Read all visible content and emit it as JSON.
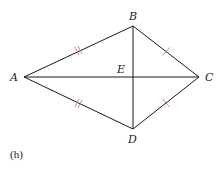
{
  "figure": {
    "caption": "(h)",
    "shape": "kite",
    "vertices": {
      "A": {
        "label": "A",
        "x": 24,
        "y": 77
      },
      "B": {
        "label": "B",
        "x": 133,
        "y": 26
      },
      "C": {
        "label": "C",
        "x": 199,
        "y": 77
      },
      "D": {
        "label": "D",
        "x": 133,
        "y": 129
      },
      "E": {
        "label": "E",
        "x": 133,
        "y": 77
      }
    },
    "segments": [
      {
        "from": "A",
        "to": "B",
        "tick_marks": 2
      },
      {
        "from": "B",
        "to": "C",
        "tick_marks": 1
      },
      {
        "from": "C",
        "to": "D",
        "tick_marks": 1
      },
      {
        "from": "D",
        "to": "A",
        "tick_marks": 2
      },
      {
        "from": "A",
        "to": "C",
        "tick_marks": 0
      },
      {
        "from": "B",
        "to": "D",
        "tick_marks": 0
      }
    ],
    "colors": {
      "line": "#1a1a1a",
      "tick": "#c7788a",
      "background": "#ffffff"
    }
  }
}
